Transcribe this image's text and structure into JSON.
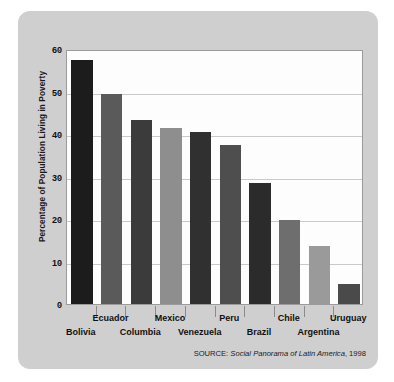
{
  "chart_data": {
    "type": "bar",
    "title": "",
    "xlabel": "",
    "ylabel": "Percentage of Population Living in Poverty",
    "ylim": [
      0,
      60
    ],
    "ytick_values": [
      0,
      10,
      20,
      30,
      40,
      50,
      60
    ],
    "ytick_labels": [
      "0",
      "10",
      "20",
      "30",
      "40",
      "50",
      "60"
    ],
    "grid": true,
    "legend": "none",
    "categories": [
      "Bolivia",
      "Ecuador",
      "Columbia",
      "Mexico",
      "Venezuela",
      "Peru",
      "Brazil",
      "Chile",
      "Argentina",
      "Uruguay"
    ],
    "values": [
      57.3,
      49.4,
      43.4,
      41.4,
      40.4,
      37.4,
      28.5,
      19.7,
      13.7,
      4.7
    ],
    "bar_colors": [
      "#1c1c1c",
      "#5a5a5a",
      "#3b3b3b",
      "#8e8e8e",
      "#303030",
      "#4e4e4e",
      "#2b2b2b",
      "#6e6e6e",
      "#9a9a9a",
      "#4a4a4a"
    ],
    "label_rows": [
      1,
      0,
      1,
      0,
      1,
      0,
      1,
      0,
      1,
      0
    ],
    "annotations": [
      {
        "name": "source",
        "prefix": "SOURCE: ",
        "title": "Social Panorama of Latin America",
        "suffix": ", 1998"
      }
    ]
  },
  "style": {
    "card_color": "#cfcfcf",
    "plot_background": "#fdfdfd",
    "gridline_color": "#c9c9c9",
    "frame_color": "#9b9b9b",
    "text_color": "#111111"
  }
}
